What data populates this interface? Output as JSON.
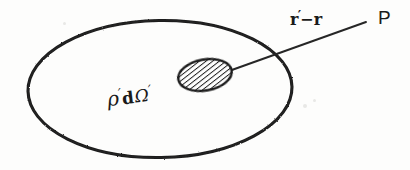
{
  "figure": {
    "kind": "hand-drawn-physics-diagram",
    "background_color": "#fdfdfc",
    "ink_color": "#1a1a1a",
    "width": 410,
    "height": 170
  },
  "labels": {
    "vector": {
      "full_text": "r'-r",
      "r_prime": "r",
      "prime_mark": "′",
      "minus": "−",
      "r": "r"
    },
    "field_point": "P",
    "source_element": {
      "full_text": "ρ'dΩ'",
      "rho": "ρ",
      "prime_mark": "′",
      "differential": "d",
      "omega": "Ω",
      "omega_prime_mark": "′"
    }
  },
  "shapes": {
    "outer_region": {
      "name": "charge-distribution-boundary",
      "cx": 160,
      "cy": 89,
      "rx": 133,
      "ry": 69,
      "rotation": -1
    },
    "source_blob": {
      "name": "hatched-volume-element",
      "cx": 205,
      "cy": 75,
      "rx": 27,
      "ry": 15,
      "rotation": -10,
      "hatch_angle_deg": 62,
      "hatch_spacing": 4
    },
    "leader_line": {
      "name": "separation-vector-line",
      "x1": 229,
      "y1": 71,
      "x2": 366,
      "y2": 22
    }
  }
}
